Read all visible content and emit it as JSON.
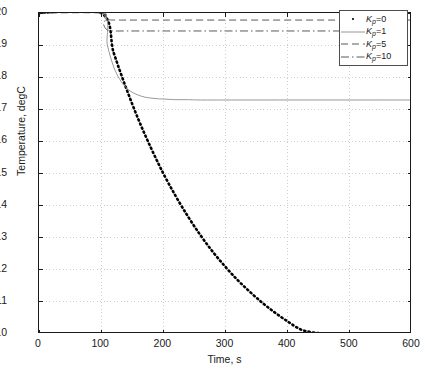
{
  "chart_data": {
    "type": "line",
    "title": "",
    "xlabel": "Time, s",
    "ylabel": "Temperature, degC",
    "xlim": [
      0,
      600
    ],
    "ylim": [
      10,
      20
    ],
    "xticks": [
      0,
      100,
      200,
      300,
      400,
      500,
      600
    ],
    "yticks": [
      10,
      11,
      12,
      13,
      14,
      15,
      16,
      17,
      18,
      19,
      20
    ],
    "grid": true,
    "grid_style": "dotted",
    "legend_position": "top-right",
    "step_time": 100,
    "initial_temperature": 20,
    "series": [
      {
        "name": "Kp=0",
        "legend_label_prefix": "K",
        "legend_label_sub": "p",
        "legend_label_suffix": "=0",
        "gain": 0,
        "style": "dotted",
        "color": "#000000",
        "width": 2.6,
        "steady_state": 10.0,
        "x": [
          0,
          100,
          120,
          140,
          160,
          180,
          200,
          220,
          240,
          260,
          280,
          300,
          320,
          340,
          360,
          380,
          400,
          420,
          440,
          460,
          480,
          500,
          520,
          540,
          560,
          580,
          600
        ],
        "y": [
          20.0,
          20.0,
          18.77,
          17.67,
          16.68,
          15.8,
          15.0,
          14.29,
          13.65,
          13.07,
          12.55,
          12.09,
          11.67,
          11.3,
          10.96,
          10.66,
          10.39,
          10.15,
          10.05,
          10.02,
          10.01,
          10.0,
          10.0,
          10.0,
          10.0,
          10.0,
          10.0
        ]
      },
      {
        "name": "Kp=1",
        "legend_label_prefix": "K",
        "legend_label_sub": "p",
        "legend_label_suffix": "=1",
        "gain": 1,
        "style": "solid",
        "color": "#8c8c8c",
        "width": 0.9,
        "steady_state": 17.29,
        "x": [
          0,
          100,
          110,
          120,
          130,
          140,
          150,
          160,
          170,
          180,
          190,
          200,
          220,
          240,
          260,
          300,
          400,
          500,
          600
        ],
        "y": [
          20.0,
          20.0,
          19.0,
          18.33,
          17.93,
          17.68,
          17.53,
          17.44,
          17.38,
          17.35,
          17.33,
          17.32,
          17.3,
          17.3,
          17.29,
          17.29,
          17.29,
          17.29,
          17.29
        ]
      },
      {
        "name": "Kp=5",
        "legend_label_prefix": "K",
        "legend_label_sub": "p",
        "legend_label_suffix": "=5",
        "gain": 5,
        "style": "dashed",
        "color": "#595959",
        "width": 1.0,
        "steady_state": 19.78,
        "x": [
          0,
          100,
          104,
          108,
          112,
          120,
          140,
          200,
          300,
          400,
          500,
          600
        ],
        "y": [
          20.0,
          20.0,
          19.88,
          19.82,
          19.79,
          19.78,
          19.78,
          19.78,
          19.78,
          19.78,
          19.78,
          19.78
        ]
      },
      {
        "name": "Kp=10",
        "legend_label_prefix": "K",
        "legend_label_sub": "p",
        "legend_label_suffix": "=10",
        "gain": 10,
        "style": "dashdot",
        "color": "#595959",
        "width": 1.0,
        "steady_state": 19.44,
        "x": [
          0,
          100,
          104,
          108,
          112,
          120,
          140,
          200,
          300,
          400,
          500,
          600
        ],
        "y": [
          20.0,
          20.0,
          19.64,
          19.5,
          19.46,
          19.44,
          19.44,
          19.44,
          19.44,
          19.44,
          19.44,
          19.44
        ]
      }
    ]
  },
  "axis": {
    "x_tick_labels": [
      "0",
      "100",
      "200",
      "300",
      "400",
      "500",
      "600"
    ],
    "y_tick_labels": [
      "20",
      "19",
      "18",
      "17",
      "16",
      "15",
      "14",
      "13",
      "12",
      "11",
      "10"
    ],
    "x_title": "Time, s",
    "y_title": "Temperature, degC"
  },
  "legend": {
    "entries": [
      {
        "label": "Kp=0",
        "k": "K",
        "sub": "p",
        "rest": "=0"
      },
      {
        "label": "Kp=1",
        "k": "K",
        "sub": "p",
        "rest": "=1"
      },
      {
        "label": "Kp=5",
        "k": "K",
        "sub": "p",
        "rest": "=5"
      },
      {
        "label": "Kp=10",
        "k": "K",
        "sub": "p",
        "rest": "=10"
      }
    ]
  },
  "colors": {
    "axis": "#1a1a1a",
    "grid": "#c8c8c8",
    "background": "#ffffff"
  }
}
